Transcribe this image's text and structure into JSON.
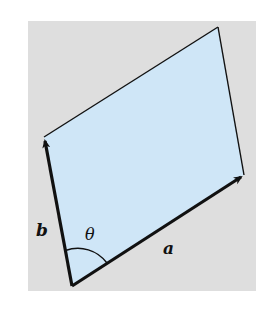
{
  "figure": {
    "colors": {
      "background_panel": "#dedede",
      "parallelogram_fill": "#cfe6f7",
      "stroke": "#111111"
    },
    "vectors": [
      {
        "name": "a",
        "label": "a",
        "from": "origin",
        "direction": "right-up"
      },
      {
        "name": "b",
        "label": "b",
        "from": "origin",
        "direction": "up"
      }
    ],
    "angle_label": "θ",
    "labels": {
      "a": "a",
      "b": "b",
      "theta": "θ"
    }
  }
}
